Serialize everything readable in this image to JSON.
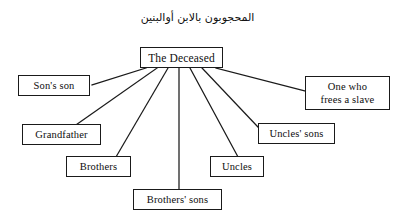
{
  "diagram": {
    "title_arabic": "المحجوبون بالابن أوالبنين",
    "type": "hierarchy-tree",
    "root": {
      "id": "the-deceased",
      "label": "The Deceased"
    },
    "nodes": [
      {
        "id": "sons-son",
        "label": "Son's son",
        "lines": [
          "Son's son"
        ]
      },
      {
        "id": "one-who-frees-a-slave",
        "label": "One who frees a slave",
        "lines": [
          "One who",
          "frees a slave"
        ]
      },
      {
        "id": "grandfather",
        "label": "Grandfather",
        "lines": [
          "Grandfather"
        ]
      },
      {
        "id": "uncles-sons",
        "label": "Uncles' sons",
        "lines": [
          "Uncles' sons"
        ]
      },
      {
        "id": "brothers",
        "label": "Brothers",
        "lines": [
          "Brothers"
        ]
      },
      {
        "id": "uncles",
        "label": "Uncles",
        "lines": [
          "Uncles"
        ]
      },
      {
        "id": "brothers-sons",
        "label": "Brothers' sons",
        "lines": [
          "Brothers' sons"
        ]
      }
    ],
    "edges": [
      {
        "from": "the-deceased",
        "to": "sons-son"
      },
      {
        "from": "the-deceased",
        "to": "grandfather"
      },
      {
        "from": "the-deceased",
        "to": "brothers"
      },
      {
        "from": "the-deceased",
        "to": "brothers-sons"
      },
      {
        "from": "the-deceased",
        "to": "uncles"
      },
      {
        "from": "the-deceased",
        "to": "uncles-sons"
      },
      {
        "from": "the-deceased",
        "to": "one-who-frees-a-slave"
      }
    ],
    "colors": {
      "line": "#1a1a1a",
      "box_border": "#1a1a1a",
      "box_fill": "#ffffff",
      "text": "#0d0d0d",
      "background": "#ffffff"
    }
  }
}
